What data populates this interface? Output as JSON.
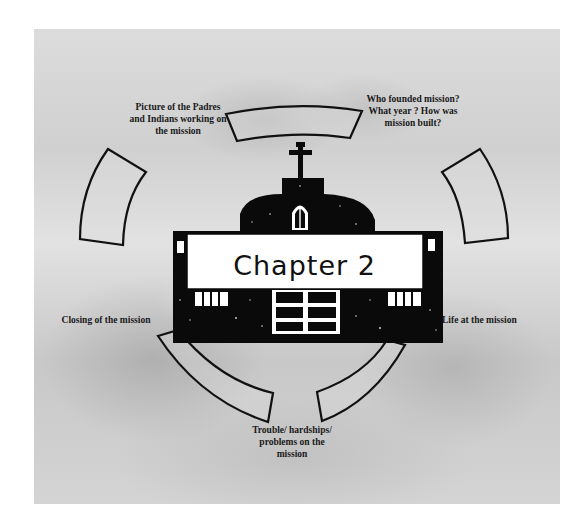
{
  "diagram": {
    "center": {
      "title": "Chapter 2",
      "shape": "mission-church-icon"
    },
    "topics": [
      {
        "id": "padres-indians",
        "label": "Picture of the Padres and Indians working on the mission",
        "position": "top-left"
      },
      {
        "id": "founding",
        "label": "Who founded mission?  What year ? How was mission built?",
        "position": "top-right"
      },
      {
        "id": "closing",
        "label": "Closing of the mission",
        "position": "left"
      },
      {
        "id": "life",
        "label": "Life at the mission",
        "position": "right"
      },
      {
        "id": "trouble",
        "label": "Trouble/ hardships/ problems on the mission",
        "position": "bottom"
      }
    ],
    "colors": {
      "outline": "#111111",
      "building": "#0a0a0a",
      "banner": "#ffffff",
      "background": "#d6d6d6"
    }
  }
}
